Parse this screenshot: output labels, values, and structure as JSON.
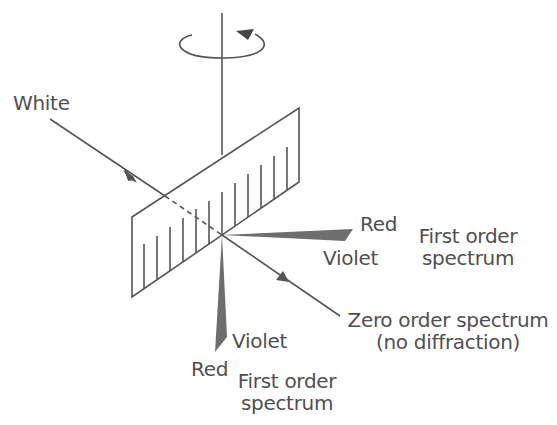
{
  "diagram": {
    "incident_label": "White",
    "horizontal_spectrum": {
      "red_label": "Red",
      "violet_label": "Violet",
      "order_line1": "First order",
      "order_line2": "spectrum"
    },
    "zero_order": {
      "line1": "Zero order spectrum",
      "line2": "(no diffraction)"
    },
    "vertical_spectrum": {
      "violet_label": "Violet",
      "red_label": "Red",
      "order_line1": "First order",
      "order_line2": "spectrum"
    },
    "colors": {
      "line": "#555555",
      "wedge": "#6e6e6e",
      "background": "#ffffff"
    }
  }
}
